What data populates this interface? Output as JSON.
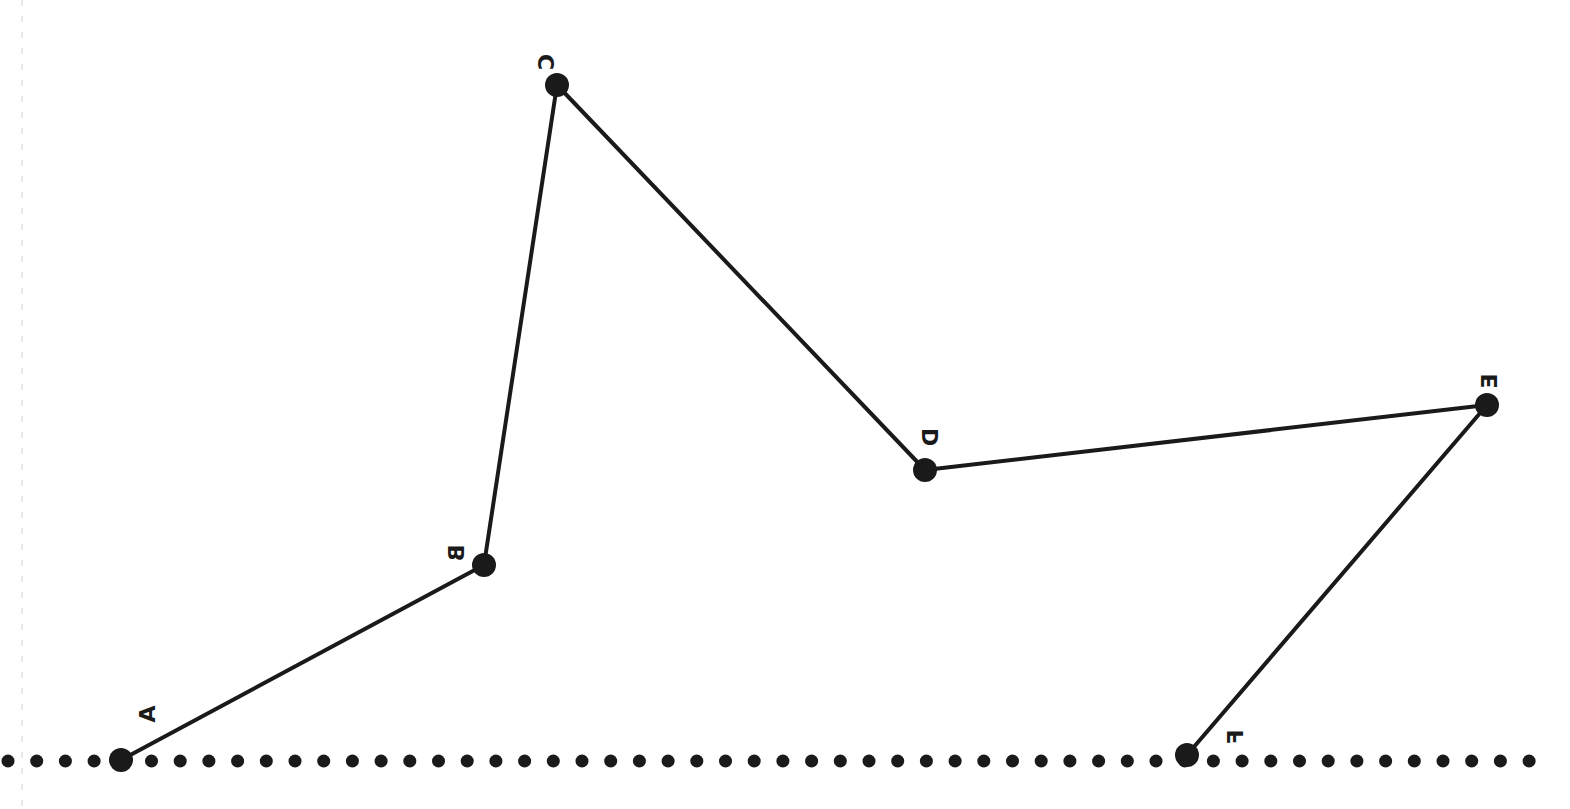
{
  "diagram": {
    "type": "polyline-on-baseline",
    "stroke_color": "#1a1a1a",
    "background": "#ffffff",
    "points": [
      {
        "label": "A",
        "x": 121,
        "y": 760,
        "label_x": 147,
        "label_y": 714
      },
      {
        "label": "B",
        "x": 484,
        "y": 565,
        "label_x": 456,
        "label_y": 553
      },
      {
        "label": "C",
        "x": 557,
        "y": 85,
        "label_x": 546,
        "label_y": 62
      },
      {
        "label": "D",
        "x": 925,
        "y": 470,
        "label_x": 930,
        "label_y": 437
      },
      {
        "label": "E",
        "x": 1487,
        "y": 405,
        "label_x": 1489,
        "label_y": 381
      },
      {
        "label": "F",
        "x": 1187,
        "y": 755,
        "label_x": 1235,
        "label_y": 737
      }
    ],
    "segments": [
      [
        "A",
        "B"
      ],
      [
        "B",
        "C"
      ],
      [
        "C",
        "D"
      ],
      [
        "D",
        "E"
      ],
      [
        "E",
        "F"
      ]
    ],
    "baseline": {
      "style": "dotted",
      "y": 761,
      "x_start": 8,
      "x_end": 1534,
      "spacing": 28.7,
      "dot_radius": 6.5
    },
    "guide_line": {
      "style": "dashed",
      "x": 22,
      "color": "#cccccc"
    }
  }
}
